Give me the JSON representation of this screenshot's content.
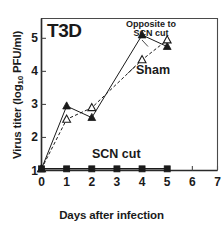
{
  "chart_data": {
    "type": "line",
    "title": "T3D",
    "xlabel": "Days after infection",
    "ylabel": "Virus titer (log10 PFU/ml)",
    "ylabel_main": "Virus titer (log",
    "ylabel_sub": "10",
    "ylabel_tail": " PFU/ml)",
    "xlim": [
      0,
      7
    ],
    "ylim": [
      1,
      5.6
    ],
    "xticks": [
      "0",
      "1",
      "2",
      "3",
      "4",
      "5",
      "6",
      "7"
    ],
    "yticks": [
      "1",
      "2",
      "3",
      "4",
      "5"
    ],
    "grid": false,
    "legend_position": "in-plot annotations",
    "annotations": [
      {
        "text": "T3D",
        "role": "panel-title"
      },
      {
        "text": "Opposite to",
        "role": "series-label-line1"
      },
      {
        "text": "SCN cut",
        "role": "series-label-line2"
      },
      {
        "text": "Sham",
        "role": "series-label"
      },
      {
        "text": "SCN cut",
        "role": "series-label"
      }
    ],
    "x": [
      0,
      1,
      2,
      3,
      4,
      5
    ],
    "series": [
      {
        "name": "Opposite to SCN cut",
        "marker": "filled-triangle",
        "color": "#1a1a1a",
        "x": [
          0,
          1,
          2,
          4,
          5
        ],
        "values": [
          1.05,
          2.95,
          2.6,
          5.1,
          4.75
        ]
      },
      {
        "name": "Sham",
        "marker": "open-triangle",
        "color": "#1a1a1a",
        "x": [
          0,
          1,
          2,
          4,
          5
        ],
        "values": [
          1.05,
          2.55,
          2.9,
          4.35,
          4.95
        ]
      },
      {
        "name": "SCN cut",
        "marker": "filled-square",
        "color": "#1a1a1a",
        "x": [
          0,
          1,
          2,
          3,
          4,
          5
        ],
        "values": [
          1.05,
          1.05,
          1.05,
          1.05,
          1.05,
          1.05
        ]
      }
    ]
  }
}
